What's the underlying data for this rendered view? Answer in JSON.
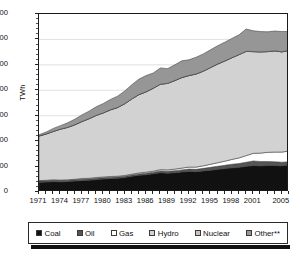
{
  "chart_data": {
    "type": "area",
    "stacked": true,
    "title": "",
    "xlabel": "",
    "ylabel": "TWh",
    "ylim": [
      0,
      700
    ],
    "ytick_values": [
      0,
      100,
      200,
      300,
      400,
      500,
      600,
      700
    ],
    "ytick_labels": [
      "0",
      "100",
      "200",
      "300",
      "400",
      "500",
      "600",
      "700"
    ],
    "grid": true,
    "grid_axis": "y",
    "legend_position": "bottom",
    "x": [
      1971,
      1972,
      1973,
      1974,
      1975,
      1976,
      1977,
      1978,
      1979,
      1980,
      1981,
      1982,
      1983,
      1984,
      1985,
      1986,
      1987,
      1988,
      1989,
      1990,
      1991,
      1992,
      1993,
      1994,
      1995,
      1996,
      1997,
      1998,
      1999,
      2000,
      2001,
      2002,
      2003,
      2004,
      2005,
      2006
    ],
    "xtick_labels": [
      "1971",
      "1974",
      "1977",
      "1980",
      "1983",
      "1986",
      "1989",
      "1992",
      "1995",
      "1998",
      "2001",
      "2005"
    ],
    "xtick_values": [
      1971,
      1974,
      1977,
      1980,
      1983,
      1986,
      1989,
      1992,
      1995,
      1998,
      2001,
      2005
    ],
    "series": [
      {
        "name": "Coal",
        "color": "#111111",
        "values": [
          38,
          39,
          41,
          40,
          41,
          43,
          45,
          46,
          49,
          51,
          53,
          54,
          57,
          62,
          66,
          68,
          72,
          76,
          74,
          76,
          79,
          81,
          80,
          83,
          86,
          89,
          92,
          95,
          97,
          101,
          104,
          103,
          104,
          104,
          103,
          106
        ]
      },
      {
        "name": "Oil",
        "color": "#555555",
        "values": [
          5,
          5,
          5,
          5,
          5,
          5,
          5,
          5,
          5,
          5,
          5,
          5,
          5,
          5,
          5,
          6,
          6,
          7,
          8,
          8,
          8,
          9,
          9,
          10,
          11,
          12,
          13,
          14,
          15,
          16,
          18,
          17,
          16,
          15,
          14,
          13
        ]
      },
      {
        "name": "Gas",
        "color": "#ffffff",
        "values": [
          2,
          2,
          2,
          2,
          2,
          2,
          3,
          3,
          3,
          3,
          3,
          3,
          3,
          3,
          4,
          4,
          4,
          5,
          5,
          6,
          7,
          8,
          9,
          10,
          12,
          14,
          16,
          19,
          22,
          26,
          30,
          33,
          36,
          38,
          40,
          42
        ]
      },
      {
        "name": "Hydro",
        "color": "#d2d2d2",
        "values": [
          175,
          182,
          190,
          200,
          206,
          214,
          224,
          234,
          244,
          252,
          262,
          270,
          282,
          296,
          308,
          316,
          326,
          336,
          340,
          348,
          356,
          360,
          366,
          372,
          380,
          388,
          394,
          400,
          406,
          410,
          400,
          398,
          396,
          398,
          394,
          396
        ]
      },
      {
        "name": "Nuclear",
        "color": "#d2d2d2",
        "values": [
          0,
          0,
          0,
          0,
          0,
          0,
          0,
          0,
          0,
          0,
          0,
          0,
          0,
          0,
          0,
          0,
          0,
          0,
          0,
          0,
          0,
          0,
          0,
          0,
          0,
          0,
          0,
          0,
          0,
          0,
          0,
          0,
          0,
          0,
          0,
          0
        ]
      },
      {
        "name": "Other**",
        "color": "#969696",
        "values": [
          5,
          8,
          12,
          14,
          18,
          22,
          26,
          30,
          34,
          37,
          41,
          45,
          50,
          56,
          61,
          64,
          60,
          64,
          58,
          62,
          66,
          62,
          66,
          68,
          70,
          72,
          74,
          76,
          78,
          88,
          82,
          80,
          78,
          78,
          80,
          74
        ]
      }
    ]
  },
  "axis": {
    "y_title": "TWh"
  },
  "legend": {
    "items": [
      {
        "label": "Coal",
        "color": "#111111"
      },
      {
        "label": "Oil",
        "color": "#555555"
      },
      {
        "label": "Gas",
        "color": "#ffffff"
      },
      {
        "label": "Hydro",
        "color": "#d2d2d2"
      },
      {
        "label": "Nuclear",
        "color": "#c4c4c4"
      },
      {
        "label": "Other**",
        "color": "#969696"
      }
    ]
  }
}
